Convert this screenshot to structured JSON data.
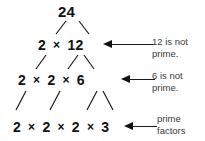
{
  "diagram": {
    "title_number": "24",
    "type": "factor-tree",
    "rows": [
      {
        "id": "row-1",
        "label": "24",
        "terms": [
          "24"
        ],
        "operators": []
      },
      {
        "id": "row-2",
        "label": "2 × 12",
        "terms": [
          "2",
          "12"
        ],
        "operators": [
          "×"
        ]
      },
      {
        "id": "row-3",
        "label": "2 × 2 × 6",
        "terms": [
          "2",
          "2",
          "6"
        ],
        "operators": [
          "×",
          "×"
        ]
      },
      {
        "id": "row-4",
        "label": "2 × 2 × 2 × 3",
        "terms": [
          "2",
          "2",
          "2",
          "3"
        ],
        "operators": [
          "×",
          "×",
          "×"
        ]
      }
    ],
    "annotations": [
      {
        "id": "ann-1",
        "line1": "12 is not",
        "line2": "prime.",
        "points_to": "row-2"
      },
      {
        "id": "ann-2",
        "line1": "6 is not",
        "line2": "prime.",
        "points_to": "row-3"
      },
      {
        "id": "ann-3",
        "line1": "prime",
        "line2": "factors",
        "points_to": "row-4"
      }
    ],
    "colors": {
      "background": "#ffffff",
      "number_text": "#111111",
      "annotation_text": "#3a3a3a",
      "stroke": "#1a1a1a"
    }
  }
}
